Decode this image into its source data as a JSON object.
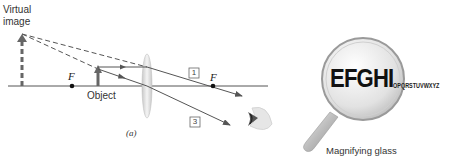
{
  "diagram": {
    "labels": {
      "virtual_image_line1": "Virtual",
      "virtual_image_line2": "image",
      "object": "Object",
      "focal_left": "F",
      "focal_right": "F",
      "ray1": "1",
      "ray3": "3",
      "caption": "(a)",
      "magnifier_big_text": "EFGHI",
      "magnifier_small_text": "OPQRSTUVWXYZ",
      "magnifier_caption": "Magnifying glass"
    },
    "colors": {
      "line": "#555555",
      "arrow_fill": "#666666",
      "lens": "#d9d9d9",
      "text": "#333333"
    }
  }
}
